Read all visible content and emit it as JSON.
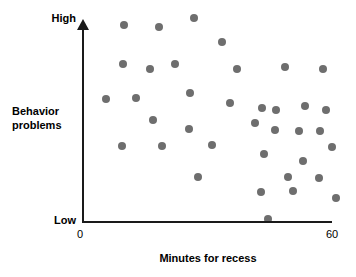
{
  "chart_data": {
    "type": "scatter",
    "title": "",
    "xlabel": "Minutes for recess",
    "ylabel": "Behavior problems",
    "x_tick_labels": [
      "0",
      "60"
    ],
    "y_tick_labels": [
      "Low",
      "High"
    ],
    "xlim": [
      0,
      60
    ],
    "ylim": [
      0,
      100
    ],
    "grid": false,
    "legend": null,
    "point_color": "#6e6e6e",
    "axis_color": "#1a1a1a",
    "background_color": "#ffffff",
    "points": [
      {
        "x": 9.9,
        "y": 98.5
      },
      {
        "x": 18.3,
        "y": 97.5
      },
      {
        "x": 26.7,
        "y": 102.0
      },
      {
        "x": 33.5,
        "y": 90.0
      },
      {
        "x": 9.6,
        "y": 79.0
      },
      {
        "x": 22.2,
        "y": 79.0
      },
      {
        "x": 16.1,
        "y": 76.5
      },
      {
        "x": 37.0,
        "y": 76.5
      },
      {
        "x": 48.6,
        "y": 77.5
      },
      {
        "x": 57.9,
        "y": 76.5
      },
      {
        "x": 5.5,
        "y": 61.5
      },
      {
        "x": 12.8,
        "y": 62.0
      },
      {
        "x": 25.7,
        "y": 64.5
      },
      {
        "x": 35.5,
        "y": 59.5
      },
      {
        "x": 43.2,
        "y": 57.0
      },
      {
        "x": 46.6,
        "y": 56.0
      },
      {
        "x": 53.5,
        "y": 58.0
      },
      {
        "x": 58.5,
        "y": 56.0
      },
      {
        "x": 16.8,
        "y": 51.0
      },
      {
        "x": 41.5,
        "y": 49.5
      },
      {
        "x": 25.5,
        "y": 46.5
      },
      {
        "x": 46.3,
        "y": 46.0
      },
      {
        "x": 52.0,
        "y": 45.5
      },
      {
        "x": 57.0,
        "y": 45.5
      },
      {
        "x": 9.4,
        "y": 38.0
      },
      {
        "x": 19.0,
        "y": 38.0
      },
      {
        "x": 31.1,
        "y": 38.5
      },
      {
        "x": 43.5,
        "y": 34.0
      },
      {
        "x": 60.0,
        "y": 37.5
      },
      {
        "x": 52.9,
        "y": 30.5
      },
      {
        "x": 27.7,
        "y": 22.5
      },
      {
        "x": 49.5,
        "y": 22.5
      },
      {
        "x": 56.9,
        "y": 22.0
      },
      {
        "x": 42.9,
        "y": 15.0
      },
      {
        "x": 50.6,
        "y": 15.5
      },
      {
        "x": 60.9,
        "y": 12.0
      },
      {
        "x": 44.6,
        "y": 1.5
      }
    ]
  },
  "labels": {
    "y_high": "High",
    "y_low": "Low",
    "y_axis_title_line1": "Behavior",
    "y_axis_title_line2": "problems",
    "x_tick_min": "0",
    "x_tick_max": "60",
    "x_axis_title": "Minutes for recess"
  }
}
